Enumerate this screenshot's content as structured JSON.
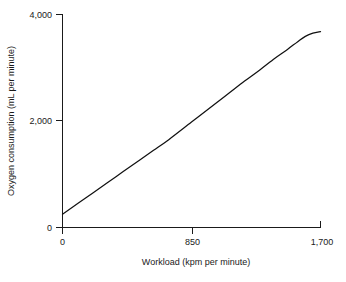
{
  "chart_data": {
    "type": "line",
    "title": "",
    "xlabel": "Workload (kpm per minute)",
    "ylabel": "Oxygen consumption (mL per minute)",
    "xlim": [
      0,
      1700
    ],
    "ylim": [
      0,
      4000
    ],
    "xticks": [
      0,
      850,
      1700
    ],
    "xtick_labels": [
      "0",
      "850",
      "1,700"
    ],
    "yticks": [
      0,
      2000,
      4000
    ],
    "ytick_labels": [
      "0",
      "2,000",
      "4,000"
    ],
    "grid": false,
    "legend": false,
    "series": [
      {
        "name": "Oxygen consumption vs workload",
        "x": [
          0,
          100,
          200,
          300,
          400,
          500,
          600,
          700,
          850,
          1000,
          1100,
          1200,
          1300,
          1400,
          1480,
          1550,
          1600,
          1650,
          1700
        ],
        "y": [
          250,
          450,
          650,
          850,
          1050,
          1250,
          1450,
          1650,
          1980,
          2310,
          2530,
          2750,
          2960,
          3180,
          3340,
          3490,
          3590,
          3650,
          3680
        ]
      }
    ],
    "line_color": "#111111",
    "axis_color": "#1a1a1a",
    "background_color": "#ffffff"
  },
  "axes": {
    "x_tick_0": "0",
    "x_tick_1": "850",
    "x_tick_2": "1,700",
    "y_tick_0": "0",
    "y_tick_1": "2,000",
    "y_tick_2": "4,000",
    "x_axis_title": "Workload (kpm per minute)",
    "y_axis_title": "Oxygen consumption (mL per minute)"
  }
}
